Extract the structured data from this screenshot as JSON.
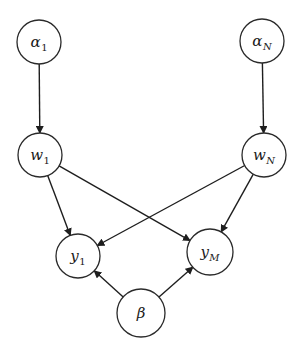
{
  "diagram": {
    "type": "graphical-model",
    "colors": {
      "stroke": "#1e1e1e",
      "fill": "#ffffff",
      "background": "#ffffff"
    },
    "nodes": [
      {
        "id": "alpha1",
        "symbol": "α",
        "subscript": "1",
        "subscript_italic": false,
        "cx": 39,
        "cy": 42,
        "r": 22
      },
      {
        "id": "alphaN",
        "symbol": "α",
        "subscript": "N",
        "subscript_italic": true,
        "cx": 262,
        "cy": 41,
        "r": 22
      },
      {
        "id": "w1",
        "symbol": "w",
        "subscript": "1",
        "subscript_italic": false,
        "cx": 40,
        "cy": 155,
        "r": 22
      },
      {
        "id": "wN",
        "symbol": "w",
        "subscript": "N",
        "subscript_italic": true,
        "cx": 264,
        "cy": 155,
        "r": 22
      },
      {
        "id": "y1",
        "symbol": "y",
        "subscript": "1",
        "subscript_italic": false,
        "cx": 78,
        "cy": 256,
        "r": 22
      },
      {
        "id": "yM",
        "symbol": "y",
        "subscript": "M",
        "subscript_italic": true,
        "cx": 210,
        "cy": 252,
        "r": 23
      },
      {
        "id": "beta",
        "symbol": "β",
        "subscript": "",
        "subscript_italic": false,
        "cx": 141,
        "cy": 313,
        "r": 24
      }
    ],
    "edges": [
      {
        "from": "alpha1",
        "to": "w1"
      },
      {
        "from": "alphaN",
        "to": "wN"
      },
      {
        "from": "w1",
        "to": "y1"
      },
      {
        "from": "w1",
        "to": "yM"
      },
      {
        "from": "wN",
        "to": "y1"
      },
      {
        "from": "wN",
        "to": "yM"
      },
      {
        "from": "beta",
        "to": "y1"
      },
      {
        "from": "beta",
        "to": "yM"
      }
    ]
  }
}
